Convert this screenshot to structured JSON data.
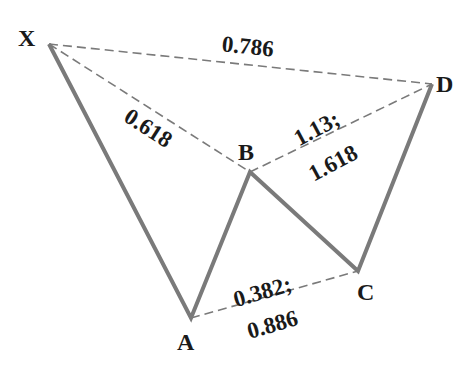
{
  "diagram": {
    "type": "harmonic pattern (Butterfly/Gartley style XABCD)",
    "line_color": "#7a7a7a",
    "points": [
      {
        "name": "X",
        "x": 49,
        "y": 44
      },
      {
        "name": "A",
        "x": 191,
        "y": 318
      },
      {
        "name": "B",
        "x": 250,
        "y": 172
      },
      {
        "name": "C",
        "x": 358,
        "y": 271
      },
      {
        "name": "D",
        "x": 432,
        "y": 84
      }
    ],
    "labels": {
      "X": "X",
      "A": "A",
      "B": "B",
      "C": "C",
      "D": "D"
    },
    "ratios": {
      "xd": "0.786",
      "xb": "0.618",
      "bd_1": "1.13;",
      "bd_2": "1.618",
      "ac_1": "0.382;",
      "ac_2": "0.886"
    }
  }
}
